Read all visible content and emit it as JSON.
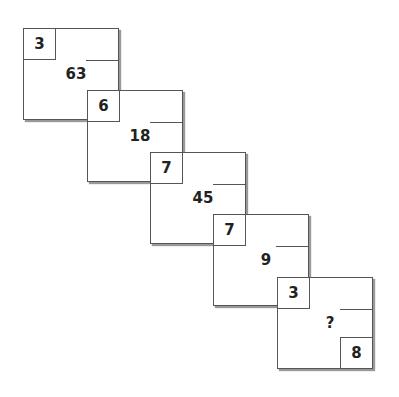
{
  "puzzle": {
    "squares": [
      {
        "corner": "3",
        "center": "63"
      },
      {
        "corner": "6",
        "center": "18"
      },
      {
        "corner": "7",
        "center": "45"
      },
      {
        "corner": "7",
        "center": "9"
      },
      {
        "corner": "3",
        "center": "?",
        "bottom_right": "8"
      }
    ]
  }
}
